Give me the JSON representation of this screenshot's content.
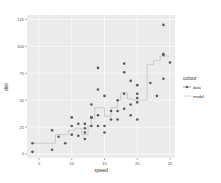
{
  "chart_data": {
    "type": "scatter",
    "title": "",
    "xlabel": "speed",
    "ylabel": "dist",
    "xlim": [
      3.95,
      25.5
    ],
    "ylim": [
      -3,
      126
    ],
    "xticks": [
      5,
      10,
      15,
      20,
      25
    ],
    "yticks": [
      0,
      25,
      50,
      75,
      100,
      125
    ],
    "grid": true,
    "legend": {
      "title": "colour",
      "position": "right",
      "entries": [
        "data",
        "model"
      ]
    },
    "series": [
      {
        "name": "data",
        "kind": "points",
        "color": "#595959",
        "x": [
          4,
          4,
          7,
          7,
          8,
          9,
          10,
          10,
          10,
          11,
          11,
          12,
          12,
          12,
          12,
          13,
          13,
          13,
          13,
          14,
          14,
          14,
          14,
          15,
          15,
          15,
          16,
          16,
          17,
          17,
          17,
          18,
          18,
          18,
          18,
          19,
          19,
          19,
          20,
          20,
          20,
          20,
          20,
          22,
          23,
          24,
          24,
          24,
          24,
          25
        ],
        "y": [
          2,
          10,
          4,
          22,
          16,
          10,
          18,
          26,
          34,
          17,
          28,
          14,
          20,
          24,
          28,
          26,
          34,
          34,
          46,
          26,
          36,
          60,
          80,
          20,
          26,
          54,
          32,
          40,
          32,
          40,
          50,
          42,
          56,
          76,
          84,
          36,
          46,
          68,
          32,
          48,
          52,
          56,
          64,
          66,
          54,
          70,
          92,
          93,
          120,
          85
        ]
      },
      {
        "name": "model",
        "kind": "step-line",
        "color": "#b3b3b3",
        "x": [
          4,
          7.5,
          7.5,
          9.5,
          9.5,
          10.5,
          10.5,
          11.5,
          11.5,
          12.5,
          12.5,
          13,
          13,
          13.5,
          13.5,
          15,
          15,
          16,
          16,
          17,
          17,
          17.5,
          17.5,
          18.5,
          18.5,
          19.5,
          19.5,
          21.5,
          21.5,
          22.5,
          22.5,
          23.5,
          23.5,
          25
        ],
        "y": [
          10,
          10,
          18,
          18,
          22,
          22,
          24,
          24,
          18,
          18,
          26,
          26,
          33,
          33,
          43,
          43,
          35,
          35,
          43,
          43,
          50,
          50,
          57,
          57,
          51,
          51,
          50,
          50,
          83,
          83,
          87,
          87,
          91,
          91
        ]
      }
    ]
  }
}
